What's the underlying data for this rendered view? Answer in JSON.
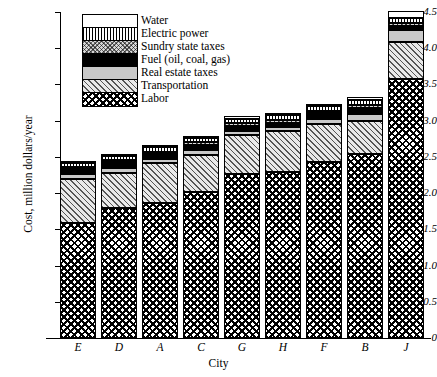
{
  "chart_data": {
    "type": "bar",
    "title": "",
    "xlabel": "City",
    "ylabel": "Cost, million dollars/year",
    "categories": [
      "E",
      "D",
      "A",
      "C",
      "G",
      "H",
      "F",
      "B",
      "J"
    ],
    "ylim": [
      0,
      4.5
    ],
    "yticks": [
      "0",
      "0.5",
      "1.0",
      "1.5",
      "2.0",
      "2.5",
      "3.0",
      "3.5",
      "4.0",
      "4.5"
    ],
    "grid": false,
    "stacked": true,
    "legend_position": "top-left",
    "series": [
      {
        "name": "Labor",
        "values": [
          1.59,
          1.79,
          1.86,
          2.01,
          2.26,
          2.29,
          2.43,
          2.54,
          3.57
        ]
      },
      {
        "name": "Transportation",
        "values": [
          0.61,
          0.49,
          0.55,
          0.52,
          0.54,
          0.57,
          0.52,
          0.45,
          0.51
        ]
      },
      {
        "name": "Real estate taxes",
        "values": [
          0.06,
          0.07,
          0.06,
          0.07,
          0.06,
          0.05,
          0.08,
          0.1,
          0.17
        ]
      },
      {
        "name": "Fuel (oil, coal, gas)",
        "values": [
          0.07,
          0.08,
          0.07,
          0.07,
          0.07,
          0.06,
          0.07,
          0.09,
          0.06
        ]
      },
      {
        "name": "Sundry state taxes",
        "values": [
          0.03,
          0.03,
          0.03,
          0.03,
          0.04,
          0.04,
          0.04,
          0.04,
          0.04
        ]
      },
      {
        "name": "Electric power",
        "values": [
          0.05,
          0.05,
          0.06,
          0.06,
          0.06,
          0.07,
          0.06,
          0.06,
          0.07
        ]
      },
      {
        "name": "Water",
        "values": [
          0.02,
          0.02,
          0.03,
          0.03,
          0.03,
          0.03,
          0.03,
          0.05,
          0.09
        ]
      }
    ],
    "totals": [
      2.43,
      2.53,
      2.66,
      2.79,
      3.06,
      3.11,
      3.23,
      3.33,
      4.51
    ]
  },
  "legend": {
    "entries": [
      {
        "label": "Water",
        "pattern": "p-water"
      },
      {
        "label": "Electric power",
        "pattern": "p-electric"
      },
      {
        "label": "Sundry state taxes",
        "pattern": "p-sundry"
      },
      {
        "label": "Fuel (oil, coal, gas)",
        "pattern": "p-fuel"
      },
      {
        "label": "Real estate taxes",
        "pattern": "p-realestate"
      },
      {
        "label": "Transportation",
        "pattern": "p-transport"
      },
      {
        "label": "Labor",
        "pattern": "p-labor"
      }
    ]
  }
}
